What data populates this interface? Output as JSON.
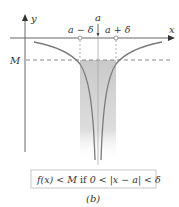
{
  "diagram": {
    "axes": {
      "x_label": "x",
      "y_label": "y"
    },
    "point": {
      "a_label": "a",
      "a_minus_delta_label": "a − δ",
      "a_plus_delta_label": "a + δ"
    },
    "threshold": {
      "label": "M"
    },
    "condition_box": {
      "text_f": "f(x) < M",
      "text_if": " if ",
      "text_cond": "0 < |x − a| < δ"
    },
    "caption": "(b)",
    "colors": {
      "curve": "#7a7a7a",
      "axis": "#666666",
      "shading": "#cfcfcf",
      "dashed": "#888888",
      "box_border": "#c8c8c8"
    }
  }
}
